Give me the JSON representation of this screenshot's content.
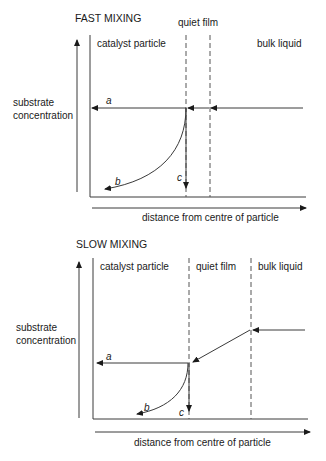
{
  "diagrams": [
    {
      "title": "FAST MIXING",
      "regions": {
        "particle": "catalyst particle",
        "film": "quiet film",
        "bulk": "bulk liquid"
      },
      "y_axis_label_line1": "substrate",
      "y_axis_label_line2": "concentration",
      "x_axis_label": "distance from centre of particle",
      "curve_labels": {
        "a": "a",
        "b": "b",
        "c": "c"
      }
    },
    {
      "title": "SLOW MIXING",
      "regions": {
        "particle": "catalyst particle",
        "film": "quiet film",
        "bulk": "bulk liquid"
      },
      "y_axis_label_line1": "substrate",
      "y_axis_label_line2": "concentration",
      "x_axis_label": "distance from centre of particle",
      "curve_labels": {
        "a": "a",
        "b": "b",
        "c": "c"
      }
    }
  ]
}
